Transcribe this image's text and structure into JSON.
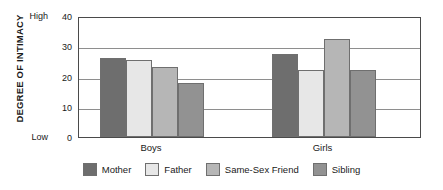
{
  "chart_data": {
    "type": "bar",
    "title": "",
    "subtitle": "",
    "xlabel": "",
    "ylabel": "DEGREE OF INTIMACY",
    "ylim": [
      0,
      40
    ],
    "yticks": [
      "0",
      "10",
      "20",
      "30",
      "40"
    ],
    "y_axis_low_label": "Low",
    "y_axis_high_label": "High",
    "grid": true,
    "grid_axis": "y",
    "legend_position": "bottom",
    "categories": [
      "Boys",
      "Girls"
    ],
    "series": [
      {
        "name": "Mother",
        "color": "#6e6e6e",
        "values": [
          26,
          27.5
        ]
      },
      {
        "name": "Father",
        "color": "#e7e7e7",
        "values": [
          25.5,
          22
        ]
      },
      {
        "name": "Same-Sex Friend",
        "color": "#b6b6b6",
        "values": [
          23,
          32.5
        ]
      },
      {
        "name": "Sibling",
        "color": "#929292",
        "values": [
          18,
          22
        ]
      }
    ]
  }
}
